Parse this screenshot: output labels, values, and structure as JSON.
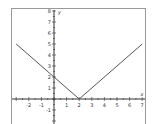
{
  "chart_data": {
    "type": "line",
    "title": "",
    "xlabel": "x",
    "ylabel": "y",
    "xlim": [
      -3,
      7
    ],
    "ylim": [
      -2,
      8
    ],
    "grid": false,
    "x_ticks": [
      -2,
      -1,
      1,
      2,
      3,
      4,
      5,
      6,
      7
    ],
    "y_ticks": [
      -1,
      1,
      2,
      3,
      4,
      5,
      6,
      7,
      8
    ],
    "series": [
      {
        "name": "y = |x - 2|",
        "x": [
          -3,
          2,
          7
        ],
        "y": [
          5,
          0,
          5
        ]
      }
    ]
  },
  "colors": {
    "line": "#555555",
    "axis": "#333333",
    "frame": "#999999"
  }
}
